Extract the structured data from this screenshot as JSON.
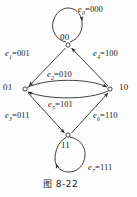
{
  "figure": {
    "caption": "图 8-22",
    "stroke_color": "#2b2b2b",
    "background_color": "#fdfdfd"
  },
  "nodes": [
    {
      "id": "00",
      "label": "00",
      "x": 68,
      "y": 45
    },
    {
      "id": "01",
      "label": "01",
      "x": 22,
      "y": 89
    },
    {
      "id": "10",
      "label": "10",
      "x": 114,
      "y": 89
    },
    {
      "id": "11",
      "label": "11",
      "x": 68,
      "y": 137
    }
  ],
  "edges": [
    {
      "id": "e0",
      "name": "e",
      "sub": "0",
      "value": "000",
      "from": "00",
      "to": "00",
      "label": "e0=000"
    },
    {
      "id": "e1",
      "name": "e",
      "sub": "1",
      "value": "001",
      "from": "00",
      "to": "01",
      "label": "e1=001"
    },
    {
      "id": "e2",
      "name": "e",
      "sub": "2",
      "value": "010",
      "from": "01",
      "to": "10",
      "label": "e2=010"
    },
    {
      "id": "e3",
      "name": "e",
      "sub": "3",
      "value": "011",
      "from": "01",
      "to": "11",
      "label": "e3=011"
    },
    {
      "id": "e4",
      "name": "e",
      "sub": "4",
      "value": "100",
      "from": "10",
      "to": "00",
      "label": "e4=100"
    },
    {
      "id": "e5",
      "name": "e",
      "sub": "5",
      "value": "101",
      "from": "10",
      "to": "01",
      "label": "e5=101"
    },
    {
      "id": "e6",
      "name": "e",
      "sub": "6",
      "value": "110",
      "from": "11",
      "to": "10",
      "label": "e6=110"
    },
    {
      "id": "e7",
      "name": "e",
      "sub": "7",
      "value": "111",
      "from": "11",
      "to": "11",
      "label": "e7=111"
    }
  ],
  "labels": {
    "e0": {
      "name": "e",
      "sub": "0",
      "value": "=000"
    },
    "e1": {
      "name": "e",
      "sub": "1",
      "value": "=001"
    },
    "e2": {
      "name": "e",
      "sub": "2",
      "value": "=010"
    },
    "e3": {
      "name": "e",
      "sub": "3",
      "value": "=011"
    },
    "e4": {
      "name": "e",
      "sub": "4",
      "value": "=100"
    },
    "e5": {
      "name": "e",
      "sub": "5",
      "value": "=101"
    },
    "e6": {
      "name": "e",
      "sub": "6",
      "value": "=110"
    },
    "e7": {
      "name": "e",
      "sub": "7",
      "value": "=111"
    }
  }
}
